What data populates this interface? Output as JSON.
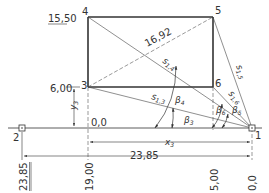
{
  "points": [
    {
      "id": "1",
      "label": "1"
    },
    {
      "id": "2",
      "label": "2"
    },
    {
      "id": "3",
      "label": "3"
    },
    {
      "id": "4",
      "label": "4"
    },
    {
      "id": "5",
      "label": "5"
    },
    {
      "id": "6",
      "label": "6"
    }
  ],
  "dimensions": {
    "height_top": "15,50",
    "height_3": "6,00",
    "origin": "0,0",
    "diagonal": "16,92",
    "total_width": "23,85",
    "x3_label": "x",
    "x3_sub": "3",
    "y3_label": "y",
    "y3_sub": "3"
  },
  "segments": {
    "s13": {
      "main": "s",
      "sub": "1,3"
    },
    "s14": {
      "main": "s",
      "sub": "1,4"
    },
    "s15": {
      "main": "s",
      "sub": "1,5"
    },
    "s16": {
      "main": "s",
      "sub": "1,6"
    }
  },
  "angles": {
    "b3": {
      "main": "β",
      "sub": "3"
    },
    "b4": {
      "main": "β",
      "sub": "4"
    },
    "b5": {
      "main": "β",
      "sub": "5"
    },
    "b6": {
      "main": "β",
      "sub": "6"
    }
  },
  "bottom_scale": [
    "23,85",
    "19,00",
    "5,00",
    "0,0"
  ]
}
